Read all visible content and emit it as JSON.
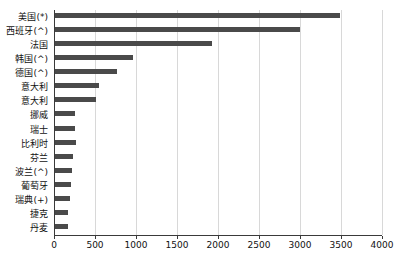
{
  "chart_data": {
    "type": "bar",
    "orientation": "horizontal",
    "title": "",
    "subtitle": "",
    "xlabel": "",
    "ylabel": "",
    "xlim": [
      0,
      4000
    ],
    "xticks": [
      0,
      500,
      1000,
      1500,
      2000,
      2500,
      3000,
      3500,
      4000
    ],
    "xtick_labels": [
      "0",
      "500",
      "1000",
      "1500",
      "2000",
      "2500",
      "3000",
      "3500",
      "4000"
    ],
    "grid": "vertical",
    "legend": null,
    "bar_color": "#4a4a4a",
    "categories": [
      "美国(*)",
      "西班牙(^)",
      "法国",
      "韩国(^)",
      "德国(^)",
      "意大利",
      "意大利",
      "挪威",
      "瑞士",
      "比利时",
      "芬兰",
      "波兰(^)",
      "葡萄牙",
      "瑞典(+)",
      "捷克",
      "丹麦"
    ],
    "values": [
      3490,
      3000,
      1930,
      960,
      770,
      550,
      510,
      255,
      260,
      265,
      230,
      215,
      205,
      195,
      175,
      165
    ]
  }
}
